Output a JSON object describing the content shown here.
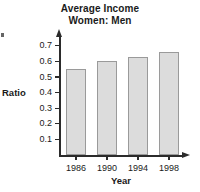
{
  "chart_data": {
    "type": "bar",
    "title": "Average Income Women: Men",
    "title_lines": [
      "Average Income",
      "Women: Men"
    ],
    "categories": [
      "1986",
      "1990",
      "1994",
      "1998"
    ],
    "values": [
      0.55,
      0.6,
      0.63,
      0.66
    ],
    "xlabel": "Year",
    "ylabel": "Ratio",
    "ylim": [
      0,
      0.75
    ],
    "ytick_labels": [
      "0.7",
      "0.6",
      "0.5",
      "0.4",
      "0.3",
      "0.2",
      "0.1"
    ],
    "ytick_values": [
      0.7,
      0.6,
      0.5,
      0.4,
      0.3,
      0.2,
      0.1
    ],
    "grid": false,
    "legend": "none",
    "bar_fill_color": "#dcdcdc",
    "bar_border_color": "#9a9a9a",
    "axis_color": "#2b2b2b"
  }
}
